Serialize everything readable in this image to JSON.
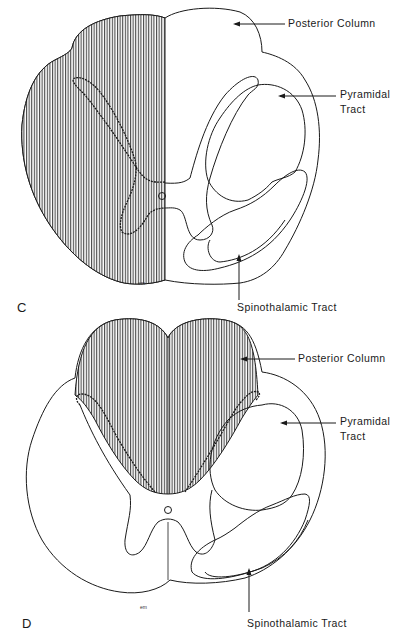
{
  "figure": {
    "panels": [
      {
        "id": "C",
        "letter": "C",
        "labels": {
          "posterior_column": "Posterior Column",
          "pyramidal_tract_line1": "Pyramidal",
          "pyramidal_tract_line2": "Tract",
          "spinothalamic_tract": "Spinothalamic Tract"
        },
        "signature": "em",
        "shaded_region": "left half of cord"
      },
      {
        "id": "D",
        "letter": "D",
        "labels": {
          "posterior_column": "Posterior Column",
          "pyramidal_tract_line1": "Pyramidal",
          "pyramidal_tract_line2": "Tract",
          "spinothalamic_tract": "Spinothalamic Tract"
        },
        "signature": "em",
        "shaded_region": "posterior columns bilaterally"
      }
    ],
    "colors": {
      "ink": "#1a1a1a",
      "background": "#ffffff"
    }
  }
}
